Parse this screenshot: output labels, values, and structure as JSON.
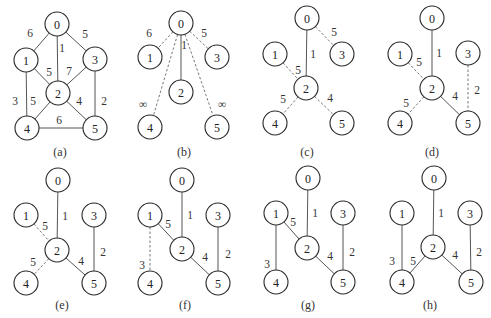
{
  "figure": {
    "node_radius": 12,
    "panels": [
      {
        "caption": "(a)",
        "caption_pos": [
          60,
          152
        ],
        "nodes": {
          "0": [
            57,
            24
          ],
          "1": [
            26,
            60
          ],
          "2": [
            58,
            93
          ],
          "3": [
            95,
            59
          ],
          "4": [
            27,
            128
          ],
          "5": [
            95,
            128
          ]
        },
        "edges": [
          {
            "u": "0",
            "v": "1",
            "w": "6",
            "style": "solid",
            "lp": [
              30,
              33
            ]
          },
          {
            "u": "0",
            "v": "2",
            "w": "1",
            "style": "solid",
            "lp": [
              62,
              48
            ]
          },
          {
            "u": "0",
            "v": "3",
            "w": "5",
            "style": "solid",
            "lp": [
              85,
              34
            ]
          },
          {
            "u": "1",
            "v": "2",
            "w": "5",
            "style": "solid",
            "lp": [
              49,
              72
            ]
          },
          {
            "u": "2",
            "v": "3",
            "w": "7",
            "style": "solid",
            "lp": [
              69,
              71
            ]
          },
          {
            "u": "1",
            "v": "4",
            "w": "3",
            "style": "solid",
            "lp": [
              15,
              101
            ]
          },
          {
            "u": "2",
            "v": "4",
            "w": "5",
            "style": "solid",
            "lp": [
              33,
              101
            ]
          },
          {
            "u": "2",
            "v": "5",
            "w": "4",
            "style": "solid",
            "lp": [
              79,
              101
            ]
          },
          {
            "u": "3",
            "v": "5",
            "w": "2",
            "style": "solid",
            "lp": [
              104,
              101
            ]
          },
          {
            "u": "4",
            "v": "5",
            "w": "6",
            "style": "solid",
            "lp": [
              59,
              120
            ]
          }
        ]
      },
      {
        "caption": "(b)",
        "caption_pos": [
          184,
          152
        ],
        "nodes": {
          "0": [
            181,
            23
          ],
          "1": [
            150,
            57
          ],
          "2": [
            181,
            92
          ],
          "3": [
            217,
            57
          ],
          "4": [
            150,
            127
          ],
          "5": [
            217,
            127
          ]
        },
        "edges": [
          {
            "u": "0",
            "v": "1",
            "w": "6",
            "style": "dashed",
            "lp": [
              149,
              33
            ]
          },
          {
            "u": "0",
            "v": "2",
            "w": "1",
            "style": "solid",
            "lp": [
              184,
              45
            ]
          },
          {
            "u": "0",
            "v": "3",
            "w": "5",
            "style": "dashed",
            "lp": [
              204,
              33
            ]
          },
          {
            "u": "0",
            "v": "4",
            "w": "∞",
            "style": "dashed",
            "lp": [
              143,
              104
            ]
          },
          {
            "u": "0",
            "v": "5",
            "w": "∞",
            "style": "dashed",
            "lp": [
              222,
              104
            ]
          }
        ]
      },
      {
        "caption": "(c)",
        "caption_pos": [
          307,
          152
        ],
        "nodes": {
          "0": [
            307,
            18
          ],
          "1": [
            275,
            54
          ],
          "2": [
            306,
            88
          ],
          "3": [
            342,
            54
          ],
          "4": [
            275,
            123
          ],
          "5": [
            342,
            123
          ]
        },
        "edges": [
          {
            "u": "0",
            "v": "2",
            "w": "1",
            "style": "solid",
            "lp": [
              313,
              54
            ]
          },
          {
            "u": "0",
            "v": "3",
            "w": "5",
            "style": "dashed",
            "lp": [
              334,
              32
            ]
          },
          {
            "u": "1",
            "v": "2",
            "w": "5",
            "style": "dashed",
            "lp": [
              298,
              70
            ]
          },
          {
            "u": "2",
            "v": "4",
            "w": "5",
            "style": "dashed",
            "lp": [
              283,
              99
            ]
          },
          {
            "u": "2",
            "v": "5",
            "w": "4",
            "style": "dashed",
            "lp": [
              330,
              98
            ]
          }
        ]
      },
      {
        "caption": "(d)",
        "caption_pos": [
          432,
          152
        ],
        "nodes": {
          "0": [
            432,
            18
          ],
          "1": [
            400,
            54
          ],
          "2": [
            432,
            88
          ],
          "3": [
            468,
            53
          ],
          "4": [
            400,
            123
          ],
          "5": [
            468,
            123
          ]
        },
        "edges": [
          {
            "u": "0",
            "v": "2",
            "w": "1",
            "style": "solid",
            "lp": [
              439,
              53
            ]
          },
          {
            "u": "1",
            "v": "2",
            "w": "5",
            "style": "dashed",
            "lp": [
              419,
              62
            ]
          },
          {
            "u": "2",
            "v": "4",
            "w": "5",
            "style": "dashed",
            "lp": [
              406,
              103
            ]
          },
          {
            "u": "2",
            "v": "5",
            "w": "4",
            "style": "solid",
            "lp": [
              455,
              96
            ]
          },
          {
            "u": "3",
            "v": "5",
            "w": "2",
            "style": "dashed",
            "lp": [
              477,
              90
            ]
          }
        ]
      },
      {
        "caption": "(e)",
        "caption_pos": [
          62,
          305
        ],
        "nodes": {
          "0": [
            58,
            180
          ],
          "1": [
            26,
            215
          ],
          "2": [
            57,
            250
          ],
          "3": [
            94,
            215
          ],
          "4": [
            26,
            283
          ],
          "5": [
            94,
            283
          ]
        },
        "edges": [
          {
            "u": "0",
            "v": "2",
            "w": "1",
            "style": "solid",
            "lp": [
              65,
              216
            ]
          },
          {
            "u": "1",
            "v": "2",
            "w": "5",
            "style": "dashed",
            "lp": [
              45,
              226
            ]
          },
          {
            "u": "2",
            "v": "4",
            "w": "5",
            "style": "dashed",
            "lp": [
              33,
              262
            ]
          },
          {
            "u": "2",
            "v": "5",
            "w": "4",
            "style": "solid",
            "lp": [
              81,
              261
            ]
          },
          {
            "u": "3",
            "v": "5",
            "w": "2",
            "style": "solid",
            "lp": [
              103,
              252
            ]
          }
        ]
      },
      {
        "caption": "(f)",
        "caption_pos": [
          185,
          305
        ],
        "nodes": {
          "0": [
            182,
            180
          ],
          "1": [
            150,
            215
          ],
          "2": [
            182,
            249
          ],
          "3": [
            218,
            215
          ],
          "4": [
            150,
            283
          ],
          "5": [
            218,
            283
          ]
        },
        "edges": [
          {
            "u": "0",
            "v": "2",
            "w": "1",
            "style": "solid",
            "lp": [
              190,
              215
            ]
          },
          {
            "u": "1",
            "v": "2",
            "w": "5",
            "style": "solid",
            "lp": [
              168,
              224
            ]
          },
          {
            "u": "1",
            "v": "4",
            "w": "3",
            "style": "dashed",
            "lp": [
              142,
              265
            ]
          },
          {
            "u": "2",
            "v": "5",
            "w": "4",
            "style": "solid",
            "lp": [
              205,
              257
            ]
          },
          {
            "u": "3",
            "v": "5",
            "w": "2",
            "style": "solid",
            "lp": [
              228,
              254
            ]
          }
        ]
      },
      {
        "caption": "(g)",
        "caption_pos": [
          308,
          305
        ],
        "nodes": {
          "0": [
            308,
            178
          ],
          "1": [
            276,
            213
          ],
          "2": [
            307,
            248
          ],
          "3": [
            343,
            213
          ],
          "4": [
            276,
            282
          ],
          "5": [
            343,
            282
          ]
        },
        "edges": [
          {
            "u": "0",
            "v": "2",
            "w": "1",
            "style": "solid",
            "lp": [
              315,
              213
            ]
          },
          {
            "u": "1",
            "v": "2",
            "w": "5",
            "style": "solid",
            "lp": [
              293,
              222
            ]
          },
          {
            "u": "1",
            "v": "4",
            "w": "3",
            "style": "solid",
            "lp": [
              267,
              264
            ]
          },
          {
            "u": "2",
            "v": "5",
            "w": "4",
            "style": "solid",
            "lp": [
              330,
              256
            ]
          },
          {
            "u": "3",
            "v": "5",
            "w": "2",
            "style": "solid",
            "lp": [
              352,
              252
            ]
          }
        ]
      },
      {
        "caption": "(h)",
        "caption_pos": [
          430,
          305
        ],
        "nodes": {
          "0": [
            434,
            178
          ],
          "1": [
            402,
            213
          ],
          "2": [
            433,
            247
          ],
          "3": [
            470,
            213
          ],
          "4": [
            402,
            282
          ],
          "5": [
            471,
            282
          ]
        },
        "edges": [
          {
            "u": "0",
            "v": "2",
            "w": "1",
            "style": "solid",
            "lp": [
              441,
              213
            ]
          },
          {
            "u": "1",
            "v": "4",
            "w": "3",
            "style": "solid",
            "lp": [
              392,
              261
            ]
          },
          {
            "u": "2",
            "v": "4",
            "w": "5",
            "style": "solid",
            "lp": [
              413,
              261
            ]
          },
          {
            "u": "2",
            "v": "5",
            "w": "4",
            "style": "solid",
            "lp": [
              455,
              255
            ]
          },
          {
            "u": "3",
            "v": "5",
            "w": "2",
            "style": "solid",
            "lp": [
              479,
              252
            ]
          }
        ]
      }
    ]
  }
}
